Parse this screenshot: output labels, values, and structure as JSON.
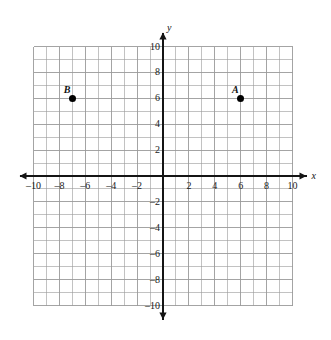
{
  "chart_data": {
    "type": "scatter",
    "title": "",
    "xlabel": "x",
    "ylabel": "y",
    "xlim": [
      -10,
      10
    ],
    "ylim": [
      -10,
      10
    ],
    "grid": true,
    "grid_step": 1,
    "tick_step": 2,
    "legend": "none",
    "x_ticks": [
      -10,
      -8,
      -6,
      -4,
      -2,
      2,
      4,
      6,
      8,
      10
    ],
    "y_ticks": [
      10,
      8,
      6,
      4,
      2,
      -2,
      -4,
      -6,
      -8,
      -10
    ],
    "x_tick_labels": [
      "–10",
      "–8",
      "–6",
      "–4",
      "–2",
      "2",
      "4",
      "6",
      "8",
      "10"
    ],
    "y_tick_labels": [
      "10",
      "8",
      "6",
      "4",
      "2",
      "–2",
      "–4",
      "–6",
      "–8",
      "–10"
    ],
    "points": [
      {
        "label": "B",
        "x": -7,
        "y": 6
      },
      {
        "label": "A",
        "x": 6,
        "y": 6
      }
    ]
  },
  "axes": {
    "x_axis_name": "x",
    "y_axis_name": "y"
  },
  "colors": {
    "grid": "#9a9a9a",
    "axis": "#141414",
    "point": "#000000",
    "text": "#1a1a1a",
    "background": "#ffffff"
  }
}
